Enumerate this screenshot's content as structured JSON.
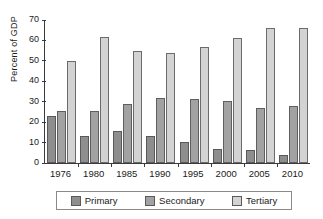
{
  "chart_data": {
    "type": "bar",
    "title": "",
    "subtitle": "",
    "xlabel": "",
    "ylabel": "Percent of GDP",
    "ylim": [
      0,
      70
    ],
    "ytick_step": 10,
    "yticks": [
      70,
      60,
      50,
      40,
      30,
      20,
      10,
      0
    ],
    "grid": false,
    "legend_position": "bottom",
    "categories": [
      "1976",
      "1980",
      "1985",
      "1990",
      "1995",
      "2000",
      "2005",
      "2010"
    ],
    "series": [
      {
        "name": "Primary",
        "color": "#8e8e8e",
        "values": [
          23,
          13,
          15.5,
          13,
          10.5,
          7,
          6.5,
          4
        ]
      },
      {
        "name": "Secondary",
        "color": "#a2a2a2",
        "values": [
          25.5,
          25.5,
          29,
          32,
          31.5,
          30.5,
          27,
          28
        ]
      },
      {
        "name": "Tertiary",
        "color": "#d3d3d3",
        "values": [
          50,
          61.5,
          55,
          54,
          57,
          61,
          66,
          66
        ]
      }
    ]
  },
  "axis": {
    "y_title": "Percent of GDP"
  },
  "legend": {
    "items": [
      {
        "label": "Primary",
        "color": "#8e8e8e"
      },
      {
        "label": "Secondary",
        "color": "#a2a2a2"
      },
      {
        "label": "Tertiary",
        "color": "#d3d3d3"
      }
    ]
  }
}
